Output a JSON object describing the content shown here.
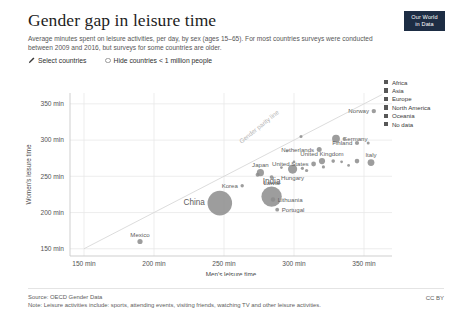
{
  "header": {
    "title": "Gender gap in leisure time",
    "subtitle": "Average minutes spent on leisure activities, per day, by sex (ages 15–65). For most countries surveys were conducted between 2009 and 2016, but surveys for some countries are older.",
    "badge_line1": "Our World",
    "badge_line2": "in Data",
    "badge_color": "#1d2d44"
  },
  "controls": [
    {
      "name": "select-countries",
      "label": "Select countries",
      "icon": "pencil-icon"
    },
    {
      "name": "hide-small-countries",
      "label": "Hide countries < 1 million people",
      "icon": "radio-icon"
    }
  ],
  "legend": {
    "items": [
      {
        "label": "Africa",
        "color": "#575757"
      },
      {
        "label": "Asia",
        "color": "#575757"
      },
      {
        "label": "Europe",
        "color": "#575757"
      },
      {
        "label": "North America",
        "color": "#575757"
      },
      {
        "label": "Oceania",
        "color": "#575757"
      },
      {
        "label": "No data",
        "color": "#575757"
      }
    ]
  },
  "footer": {
    "source": "Source: OECD Gender Data",
    "note": "Note: Leisure activities include: sports, attending events, visiting friends, watching TV and other leisure activities.",
    "license": "CC BY"
  },
  "chart_data": {
    "type": "scatter",
    "title": "Gender gap in leisure time",
    "subtitle": "Average minutes spent on leisure activities, per day, by sex (ages 15–65). For most countries surveys were conducted between 2009 and 2016, but surveys for some countries are older.",
    "xlabel": "Men's leisure time",
    "ylabel": "Women's leisure time",
    "xlim": [
      140,
      370
    ],
    "ylim": [
      140,
      365
    ],
    "xticks": [
      150,
      200,
      250,
      300,
      350
    ],
    "yticks": [
      150,
      200,
      250,
      300,
      350
    ],
    "xtick_labels": [
      "150 min",
      "200 min",
      "250 min",
      "300 min",
      "350 min"
    ],
    "ytick_labels": [
      "150 min",
      "200 min",
      "250 min",
      "300 min",
      "350 min"
    ],
    "grid": true,
    "legend_position": "right",
    "point_color": "#8c8c8c",
    "annotations": [
      {
        "text": "Gender parity line",
        "x": 276,
        "y": 316,
        "rotation": -39
      }
    ],
    "reference_line": {
      "name": "gender parity line",
      "from": [
        150,
        150
      ],
      "to": [
        363,
        363
      ]
    },
    "size_encoding": "population",
    "points": [
      {
        "label": "Mexico",
        "x": 190,
        "y": 160,
        "r": 2.6,
        "labeled": true,
        "label_pos": "above"
      },
      {
        "label": "China",
        "x": 247,
        "y": 213,
        "r": 12.3,
        "labeled": true,
        "label_pos": "left"
      },
      {
        "label": "India",
        "x": 284,
        "y": 222,
        "r": 10.2,
        "labeled": true,
        "label_pos": "above"
      },
      {
        "label": "Lithuania",
        "x": 285,
        "y": 218,
        "r": 2.2,
        "labeled": true,
        "label_pos": "right"
      },
      {
        "label": "Portugal",
        "x": 288,
        "y": 204,
        "r": 1.9,
        "labeled": true,
        "label_pos": "right"
      },
      {
        "label": "Korea",
        "x": 263,
        "y": 237,
        "r": 1.7,
        "labeled": true,
        "label_pos": "left"
      },
      {
        "label": "Latvia",
        "x": 284,
        "y": 249,
        "r": 1.9,
        "labeled": true,
        "label_pos": "below"
      },
      {
        "label": "Japan",
        "x": 276,
        "y": 255,
        "r": 3.6,
        "labeled": true,
        "label_pos": "above"
      },
      {
        "label": "Hungary",
        "x": 299,
        "y": 260,
        "r": 4.6,
        "labeled": true,
        "label_pos": "below"
      },
      {
        "label": "United States",
        "x": 314,
        "y": 267,
        "r": 2.4,
        "labeled": true,
        "label_pos": "left"
      },
      {
        "label": "United Kingdom",
        "x": 320,
        "y": 271,
        "r": 3.1,
        "labeled": true,
        "label_pos": "above"
      },
      {
        "label": "Netherlands",
        "x": 318,
        "y": 287,
        "r": 2.5,
        "labeled": true,
        "label_pos": "left"
      },
      {
        "label": "Germany",
        "x": 330,
        "y": 302,
        "r": 3.9,
        "labeled": true,
        "label_pos": "right"
      },
      {
        "label": "Finland",
        "x": 345,
        "y": 296,
        "r": 2.1,
        "labeled": true,
        "label_pos": "left"
      },
      {
        "label": "Italy",
        "x": 355,
        "y": 269,
        "r": 3.4,
        "labeled": true,
        "label_pos": "above"
      },
      {
        "label": "Norway",
        "x": 357,
        "y": 340,
        "r": 2.2,
        "labeled": true,
        "label_pos": "left"
      },
      {
        "label": "",
        "x": 295,
        "y": 285,
        "r": 1.3,
        "labeled": false
      },
      {
        "label": "",
        "x": 305,
        "y": 305,
        "r": 1.5,
        "labeled": false
      },
      {
        "label": "",
        "x": 328,
        "y": 271,
        "r": 1.8,
        "labeled": false
      },
      {
        "label": "",
        "x": 334,
        "y": 270,
        "r": 1.4,
        "labeled": false
      },
      {
        "label": "",
        "x": 339,
        "y": 265,
        "r": 1.4,
        "labeled": false
      },
      {
        "label": "",
        "x": 345,
        "y": 271,
        "r": 2.3,
        "labeled": false
      },
      {
        "label": "",
        "x": 353,
        "y": 296,
        "r": 1.5,
        "labeled": false
      },
      {
        "label": "",
        "x": 336,
        "y": 302,
        "r": 1.5,
        "labeled": false
      },
      {
        "label": "",
        "x": 306,
        "y": 261,
        "r": 1.6,
        "labeled": false
      },
      {
        "label": "",
        "x": 309,
        "y": 258,
        "r": 1.6,
        "labeled": false
      },
      {
        "label": "",
        "x": 291,
        "y": 262,
        "r": 1.4,
        "labeled": false
      },
      {
        "label": "",
        "x": 274,
        "y": 252,
        "r": 2.0,
        "labeled": false
      },
      {
        "label": "",
        "x": 321,
        "y": 263,
        "r": 1.6,
        "labeled": false
      },
      {
        "label": "",
        "x": 300,
        "y": 270,
        "r": 1.3,
        "labeled": false
      }
    ]
  }
}
